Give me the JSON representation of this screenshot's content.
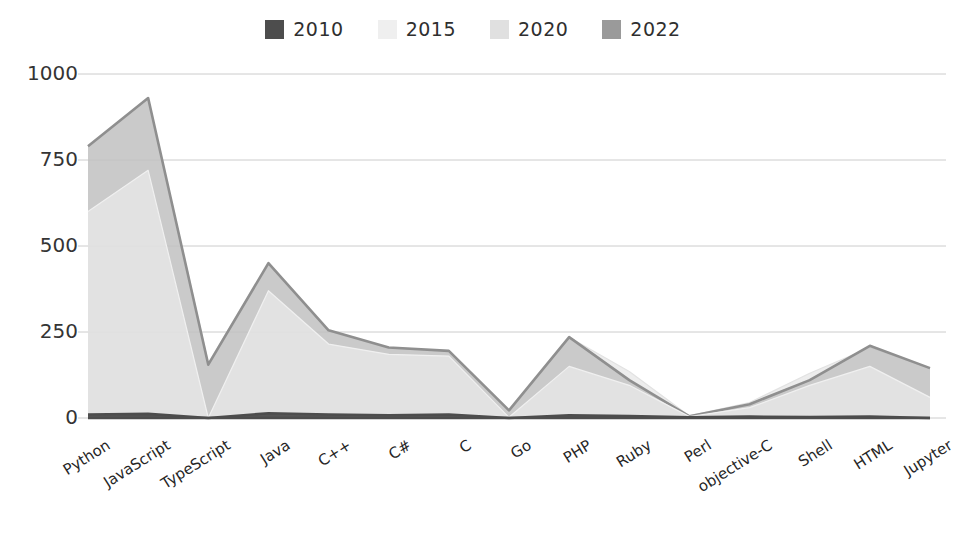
{
  "chart_data": {
    "type": "area",
    "title": "",
    "subtitle": "",
    "xlabel": "",
    "ylabel": "",
    "grid": true,
    "legend_position": "top-center",
    "ylim": [
      0,
      1000
    ],
    "yticks": [
      0,
      250,
      500,
      750,
      1000
    ],
    "ytick_labels": [
      "0",
      "250",
      "500",
      "750",
      "1000"
    ],
    "categories": [
      "Python",
      "JavaScript",
      "TypeScript",
      "Java",
      "C++",
      "C#",
      "C",
      "Go",
      "PHP",
      "Ruby",
      "Perl",
      "objective-C",
      "Shell",
      "HTML",
      "Jupyter"
    ],
    "series": [
      {
        "name": "2010",
        "color": "#4d4d4d",
        "fill": "#4d4d4d",
        "values": [
          10,
          12,
          0,
          14,
          10,
          8,
          10,
          0,
          8,
          6,
          2,
          4,
          3,
          4,
          0
        ]
      },
      {
        "name": "2015",
        "color": "#f0f0f0",
        "fill": "#f0f0f0",
        "values": [
          600,
          720,
          0,
          370,
          215,
          185,
          180,
          2,
          150,
          95,
          4,
          30,
          95,
          150,
          60
        ]
      },
      {
        "name": "2020",
        "color": "#e2e2e2",
        "fill": "#e2e2e2",
        "values": [
          790,
          930,
          160,
          450,
          255,
          205,
          195,
          20,
          235,
          135,
          6,
          45,
          130,
          205,
          145
        ]
      },
      {
        "name": "2022",
        "color": "#8f8f8f",
        "fill": "#b4b4b4",
        "values": [
          790,
          930,
          155,
          450,
          255,
          205,
          195,
          22,
          235,
          110,
          5,
          40,
          110,
          210,
          145
        ]
      }
    ]
  },
  "legend": {
    "entries": [
      {
        "label": "2010",
        "swatch_color": "#4d4d4d",
        "icon": "legend-swatch-icon"
      },
      {
        "label": "2015",
        "swatch_color": "#efefef",
        "icon": "legend-swatch-icon"
      },
      {
        "label": "2020",
        "swatch_color": "#e0e0e0",
        "icon": "legend-swatch-icon"
      },
      {
        "label": "2022",
        "swatch_color": "#9a9a9a",
        "icon": "legend-swatch-icon"
      }
    ]
  },
  "axes": {
    "y": {
      "ticks": [
        "1000",
        "750",
        "500",
        "250",
        "0"
      ]
    },
    "x": {
      "ticks": [
        "Python",
        "JavaScript",
        "TypeScript",
        "Java",
        "C++",
        "C#",
        "C",
        "Go",
        "PHP",
        "Ruby",
        "Perl",
        "objective-C",
        "Shell",
        "HTML",
        "Jupyter"
      ]
    }
  },
  "style": {
    "gridline_color": "#cccccc",
    "axis_text_color": "#333333",
    "background": "#ffffff"
  }
}
